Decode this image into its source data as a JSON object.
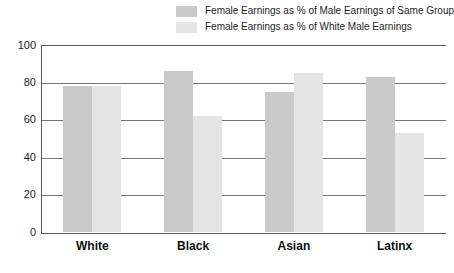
{
  "chart_data": {
    "type": "bar",
    "title": "",
    "subtitle": "",
    "xlabel": "",
    "ylabel": "",
    "categories": [
      "White",
      "Black",
      "Asian",
      "Latinx"
    ],
    "series": [
      {
        "name": "Female Earnings as % of Male Earnings of Same Group",
        "color": "#c9c9c9",
        "values": [
          78,
          86,
          75,
          83
        ]
      },
      {
        "name": "Female Earnings as % of White Male Earnings",
        "color": "#e4e4e4",
        "values": [
          78,
          62,
          85,
          53
        ]
      }
    ],
    "ylim": [
      0,
      100
    ],
    "yticks": [
      100,
      80,
      60,
      40,
      20,
      0
    ],
    "ytick_labels": [
      "100",
      "80",
      "60",
      "40",
      "20",
      "0"
    ],
    "grid": true,
    "grid_axis": "y",
    "legend_position": "top-right",
    "annotations": []
  },
  "legend": {
    "items": [
      {
        "label": "Female Earnings as % of Male Earnings of Same Group",
        "swatch": "#c9c9c9"
      },
      {
        "label": "Female Earnings as % of White Male Earnings",
        "swatch": "#e4e4e4"
      }
    ]
  },
  "colors": {
    "series_dark": "#c9c9c9",
    "series_light": "#e4e4e4",
    "axis": "#5a5a5a",
    "gridline": "#777777",
    "text": "#1d1d1d",
    "background": "#ffffff"
  }
}
